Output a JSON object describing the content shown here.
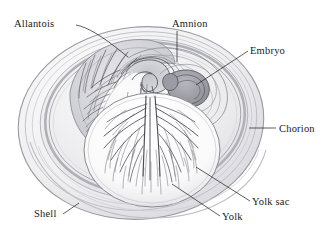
{
  "figure": {
    "background_color": "#ffffff",
    "width": 333,
    "height": 234
  },
  "labels": [
    {
      "id": "allantois",
      "text": "Allantois",
      "x": 14,
      "y": 27,
      "anchor": "start",
      "leader": "M 76,25 C 88,27 104,38 118,49 L 128,57"
    },
    {
      "id": "amnion",
      "text": "Amnion",
      "x": 172,
      "y": 27,
      "anchor": "start",
      "leader": "M 177,31 L 177,62"
    },
    {
      "id": "embryo",
      "text": "Embryo",
      "x": 250,
      "y": 54,
      "anchor": "start",
      "leader": "M 248,51 L 196,85"
    },
    {
      "id": "chorion",
      "text": "Chorion",
      "x": 279,
      "y": 132,
      "anchor": "start",
      "leader": "M 276,128 L 249,128"
    },
    {
      "id": "yolk-sac",
      "text": "Yolk sac",
      "x": 252,
      "y": 205,
      "anchor": "start",
      "leader": "M 250,201 L 196,167"
    },
    {
      "id": "yolk",
      "text": "Yolk",
      "x": 222,
      "y": 220,
      "anchor": "start",
      "leader": "M 220,216 L 172,184"
    },
    {
      "id": "shell",
      "text": "Shell",
      "x": 34,
      "y": 217,
      "anchor": "start",
      "leader": "M 63,214 L 79,203"
    }
  ],
  "colors": {
    "ink": "#1a1a1a",
    "shell_outer": "#c9c9ce",
    "shell_fill": "#f2f2f3",
    "albumen_fill": "#e8e8ea",
    "chorion_band": "#b9b9c0",
    "allantois_fill": "#d8d8dd",
    "embryo_fill": "#a5a5ad",
    "yolk_fill": "#fbfbfc",
    "vessel": "#4a4a52",
    "membrane": "#6f6f78"
  },
  "structures": [
    {
      "id": "shell",
      "name": "Shell",
      "description": "Outer calcified oval boundary with concentric layered bands"
    },
    {
      "id": "chorion",
      "name": "Chorion",
      "description": "Membrane band lining the inside of the shell"
    },
    {
      "id": "allantois",
      "name": "Allantois",
      "description": "Crescent sac in the upper-left filled with branching blood vessels"
    },
    {
      "id": "amnion",
      "name": "Amnion",
      "description": "Spiralling membrane folds surrounding the embryo"
    },
    {
      "id": "embryo",
      "name": "Embryo",
      "description": "Dark grey coiled body at upper centre-right"
    },
    {
      "id": "yolk-sac",
      "name": "Yolk sac",
      "description": "Large lower sphere covered by a radiating vitelline vessel network"
    },
    {
      "id": "yolk",
      "name": "Yolk",
      "description": "Pale interior of the yolk sphere"
    }
  ]
}
